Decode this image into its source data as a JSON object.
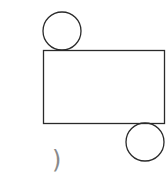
{
  "figure": {
    "stroke_color": "#2a2a2a",
    "top_circle": {
      "cx": 62,
      "cy": 31,
      "r": 19
    },
    "rectangle": {
      "x": 43,
      "y": 50,
      "width": 122,
      "height": 74
    },
    "bottom_circle": {
      "cx": 145,
      "cy": 142,
      "r": 19
    },
    "label": ")"
  }
}
